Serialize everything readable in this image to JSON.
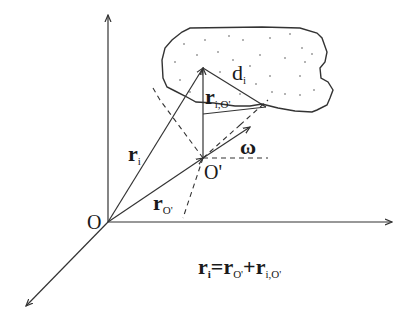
{
  "diagram": {
    "colors": {
      "stroke": "#333333",
      "background": "#ffffff",
      "text": "#1a1a1a"
    },
    "labels": {
      "origin": "O",
      "moving_origin": "O'",
      "r_i": {
        "main": "r",
        "sub": "i"
      },
      "r_O": {
        "main": "r",
        "sub": "O'"
      },
      "r_iO": {
        "main": "r",
        "sub": "i,O'"
      },
      "d_i": {
        "main": "d",
        "sub": "i"
      },
      "omega": "ω"
    },
    "equation": {
      "lhs_main": "r",
      "lhs_sub": "i",
      "eq": "=",
      "t1_main": "r",
      "t1_sub": "O'",
      "plus": "+",
      "t2_main": "r",
      "t2_sub": "i,O'"
    },
    "points": {
      "O": [
        108,
        222
      ],
      "O_prime": [
        203,
        158
      ],
      "particle": [
        203,
        68
      ]
    },
    "axes": [
      {
        "name": "vertical",
        "from": [
          108,
          222
        ],
        "to": [
          108,
          15
        ]
      },
      {
        "name": "horizontal",
        "from": [
          108,
          222
        ],
        "to": [
          392,
          222
        ]
      },
      {
        "name": "depth",
        "from": [
          108,
          222
        ],
        "to": [
          26,
          306
        ]
      }
    ]
  }
}
